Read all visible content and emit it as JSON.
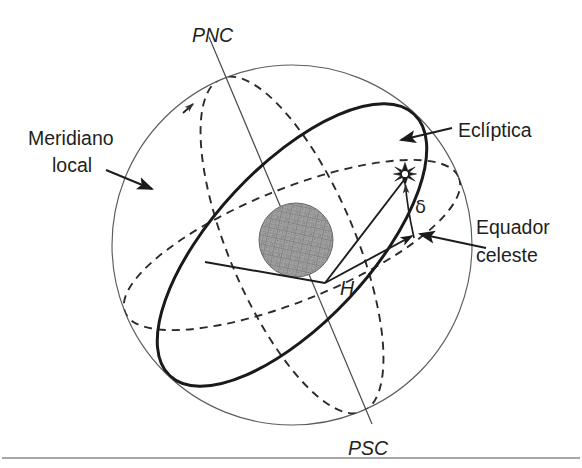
{
  "figure": {
    "language": "pt-BR",
    "background_color": "#ffffff",
    "ink_color": "#231f20"
  },
  "labels": {
    "north_pole": "PNC",
    "south_pole": "PSC",
    "meridian_line1": "Meridiano",
    "meridian_line2": "local",
    "ecliptic": "Eclíptica",
    "equator_line1": "Equador",
    "equator_line2": "celeste",
    "declination": "δ",
    "hour_angle": "H"
  },
  "geometry": {
    "sphere": {
      "cx": 292,
      "cy": 245,
      "r": 180,
      "stroke": "#5d5d5d"
    },
    "earth": {
      "cx": 296,
      "cy": 240,
      "r": 37,
      "fill": "#9a9a9a"
    },
    "star": {
      "x": 405,
      "y": 174,
      "points": 8,
      "outer_r": 11,
      "inner_r": 4
    },
    "axis": {
      "x1": 209,
      "y1": 37,
      "x2": 372,
      "y2": 424,
      "label_top": "PNC",
      "label_bottom": "PSC"
    },
    "hour_angle_vertex": {
      "x": 325,
      "y": 283
    },
    "declination_foot": {
      "x": 414,
      "y": 238
    }
  },
  "styles": {
    "ecliptic_stroke": "#1a1a1a",
    "ecliptic_width": 3.0,
    "equator_stroke": "#2b2b2b",
    "equator_dash": "8 6",
    "meridian_stroke": "#2b2b2b",
    "meridian_dash": "8 6",
    "outline_stroke": "#5d5d5d",
    "rule_stroke": "#8a8a8a"
  },
  "annotations": [
    {
      "name": "meridiano-local",
      "text": "Meridiano local",
      "target": "dashed meridian great circle",
      "arrow": true
    },
    {
      "name": "ecliptica",
      "text": "Eclíptica",
      "target": "bold ecliptic great circle",
      "arrow": true
    },
    {
      "name": "equador-celeste",
      "text": "Equador celeste",
      "target": "dashed celestial equator",
      "arrow": true
    },
    {
      "name": "declinacao",
      "text": "δ",
      "target": "arc from equator to star",
      "arrow": true
    },
    {
      "name": "angulo-horario",
      "text": "H",
      "target": "angle at sphere centre",
      "arrow": true
    }
  ]
}
